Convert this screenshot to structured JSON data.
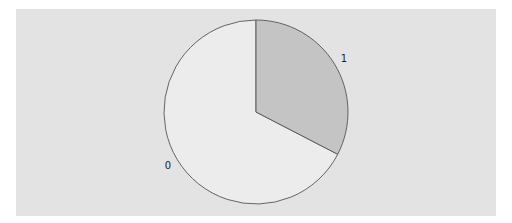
{
  "colors": {
    "background": "#ffffff",
    "panel": "#e3e3e3",
    "edge": "#555555"
  },
  "chart_data": {
    "type": "pie",
    "title": "",
    "labels": [
      "0",
      "1"
    ],
    "values": [
      67.4,
      32.6
    ],
    "colors": [
      "#ececec",
      "#c4c4c4"
    ],
    "startangle": 90,
    "counterclock": true,
    "legend": false,
    "layout": {
      "center": [
        256,
        112
      ],
      "radius": 92
    }
  }
}
